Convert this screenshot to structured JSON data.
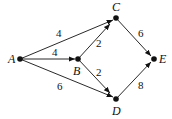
{
  "diagram": {
    "type": "directed-weighted-graph",
    "nodes": [
      {
        "id": "A",
        "label": "A",
        "x": 20,
        "y": 59
      },
      {
        "id": "B",
        "label": "B",
        "x": 78,
        "y": 59
      },
      {
        "id": "C",
        "label": "C",
        "x": 116,
        "y": 18
      },
      {
        "id": "D",
        "label": "D",
        "x": 116,
        "y": 99
      },
      {
        "id": "E",
        "label": "E",
        "x": 154,
        "y": 59
      }
    ],
    "edges": [
      {
        "from": "A",
        "to": "C",
        "weight": "4"
      },
      {
        "from": "A",
        "to": "B",
        "weight": "4"
      },
      {
        "from": "A",
        "to": "D",
        "weight": "6"
      },
      {
        "from": "B",
        "to": "C",
        "weight": "2"
      },
      {
        "from": "B",
        "to": "D",
        "weight": "2"
      },
      {
        "from": "C",
        "to": "E",
        "weight": "6"
      },
      {
        "from": "D",
        "to": "E",
        "weight": "8"
      }
    ],
    "color": "#111111"
  }
}
